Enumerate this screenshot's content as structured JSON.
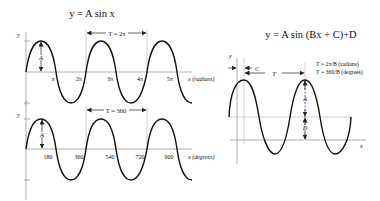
{
  "diagram": {
    "title_left": "y = A sin x",
    "title_right": "y = A sin (Bx + C)+D",
    "top_plot": {
      "y_label": "y",
      "amplitude_label": "A",
      "period_label": "T = 2π",
      "x_ticks": [
        "π",
        "2π",
        "3π",
        "4π",
        "5π"
      ],
      "x_axis_label": "x (radians)"
    },
    "bottom_plot": {
      "y_label": "y",
      "amplitude_label": "A",
      "period_label": "T = 360",
      "x_ticks": [
        "180",
        "360",
        "540",
        "720",
        "900"
      ],
      "x_axis_label": "x (degrees)"
    },
    "right_plot": {
      "y_label": "y",
      "phase_label": "C",
      "period_label": "T",
      "amplitude_label": "A",
      "offset_label": "D",
      "x_axis_label": "x",
      "formula_radians": "T = 2π/B (radians)",
      "formula_degrees": "T = 360/B (degrees)"
    }
  }
}
